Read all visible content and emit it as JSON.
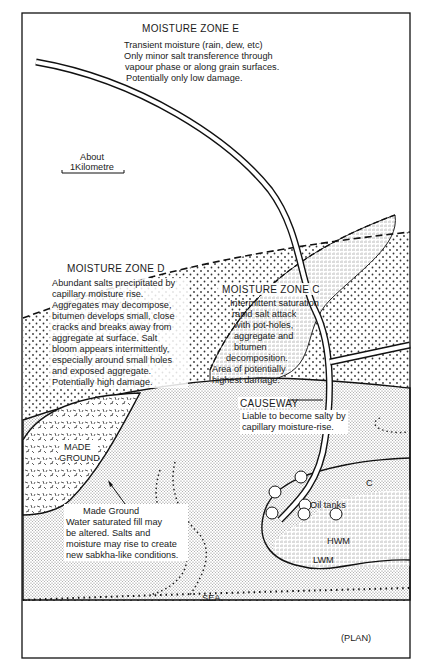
{
  "figure": {
    "view_label": "(PLAN)",
    "scale_bar": {
      "line1": "About",
      "line2": "1Kilometre"
    }
  },
  "zones": {
    "E": {
      "title": "MOISTURE ZONE E",
      "lines": [
        "Transient moisture (rain, dew, etc)",
        "Only minor salt transference through",
        "vapour phase or along grain surfaces.",
        "Potentially only low damage."
      ]
    },
    "D": {
      "title": "MOISTURE ZONE D",
      "lines": [
        "Abundant salts precipitated by",
        "capillary moisture rise.",
        "Aggregates may decompose,",
        "bitumen develops small, close",
        "cracks and breaks away from",
        "aggregate at surface. Salt",
        "bloom appears intermittently,",
        "especially around small holes",
        "and exposed aggregate.",
        "Potentially high damage."
      ]
    },
    "C": {
      "title": "MOISTURE ZONE C",
      "lines": [
        "Intermittent saturation",
        "rapid salt attack",
        "with pot-holes,",
        "aggregate and",
        "bitumen",
        "decomposition.",
        "Area of potentially",
        "highest damage."
      ]
    }
  },
  "causeway": {
    "title": "CAUSEWAY",
    "lines": [
      "Liable to become salty by",
      "capillary moisture-rise."
    ]
  },
  "made_ground": {
    "area_label_1": "MADE",
    "area_label_2": "GROUND",
    "note_title": "Made Ground",
    "note_lines": [
      "Water saturated fill may",
      "be altered. Salts and",
      "moisture may rise to create",
      "new sabkha-like conditions."
    ]
  },
  "labels": {
    "oil_tanks": "Oil tanks",
    "zone_c_marker": "C",
    "hwm": "HWM",
    "lwm": "LWM",
    "sea": "SEA"
  }
}
